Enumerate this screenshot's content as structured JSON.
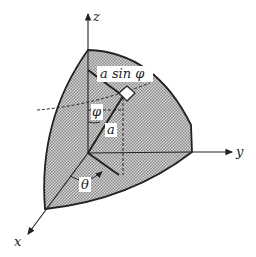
{
  "diagram": {
    "type": "spherical-coordinates-octant",
    "axes": {
      "z": "z",
      "y": "y",
      "x": "x"
    },
    "labels": {
      "radius": "a",
      "projected_radius": "a sin φ",
      "polar_angle": "φ",
      "azimuth_angle": "θ"
    },
    "colors": {
      "surface_fill": "#bdbdbd",
      "stroke": "#222222",
      "background": "#ffffff"
    }
  }
}
